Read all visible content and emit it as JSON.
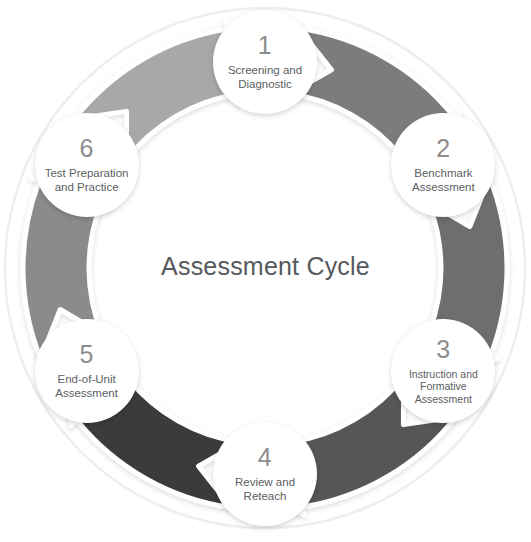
{
  "diagram": {
    "title": "Assessment Cycle",
    "type": "cycle-diagram",
    "direction": "clockwise",
    "background_color": "#ffffff",
    "title_color": "#55595c",
    "number_color": "#8d8d8d",
    "label_color": "#5b6063",
    "outer_ring_color": "#eeeeee",
    "node_fill": "#ffffff",
    "steps": [
      {
        "number": "1",
        "label_lines": [
          "Screening and",
          "Diagnostic"
        ],
        "label": "Screening and Diagnostic",
        "angle_deg": 270,
        "arrow_color": "#7b7b7b"
      },
      {
        "number": "2",
        "label_lines": [
          "Benchmark",
          "Assessment"
        ],
        "label": "Benchmark Assessment",
        "angle_deg": 330,
        "arrow_color": "#7b7b7b"
      },
      {
        "number": "3",
        "label_lines": [
          "Instruction and",
          "Formative",
          "Assessment"
        ],
        "label": "Instruction and Formative Assessment",
        "angle_deg": 30,
        "arrow_color": "#6e6e6e"
      },
      {
        "number": "4",
        "label_lines": [
          "Review and",
          "Reteach"
        ],
        "label": "Review and Reteach",
        "angle_deg": 90,
        "arrow_color": "#3a3a3a"
      },
      {
        "number": "5",
        "label_lines": [
          "End-of-Unit",
          "Assessment"
        ],
        "label": "End-of-Unit Assessment",
        "angle_deg": 150,
        "arrow_color": "#8b8b8b"
      },
      {
        "number": "6",
        "label_lines": [
          "Test Preparation",
          "and Practice"
        ],
        "label": "Test Preparation and Practice",
        "angle_deg": 210,
        "arrow_color": "#a8a8a8"
      }
    ],
    "arrow_segments": [
      {
        "from": "1",
        "to": "2",
        "color": "#7b7b7b"
      },
      {
        "from": "2",
        "to": "3",
        "color": "#6e6e6e"
      },
      {
        "from": "3",
        "to": "4",
        "color": "#565656"
      },
      {
        "from": "4",
        "to": "5",
        "color": "#3a3a3a"
      },
      {
        "from": "5",
        "to": "6",
        "color": "#8b8b8b"
      },
      {
        "from": "6",
        "to": "1",
        "color": "#a8a8a8"
      }
    ]
  }
}
